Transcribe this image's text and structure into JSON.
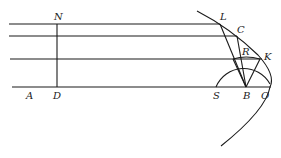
{
  "diagram": {
    "labels": {
      "N": "N",
      "L": "L",
      "C": "C",
      "R": "R",
      "K": "K",
      "A": "A",
      "D": "D",
      "S": "S",
      "B": "B",
      "O": "O"
    },
    "colors": {
      "stroke": "#1a1a1a",
      "background": "#ffffff"
    }
  }
}
